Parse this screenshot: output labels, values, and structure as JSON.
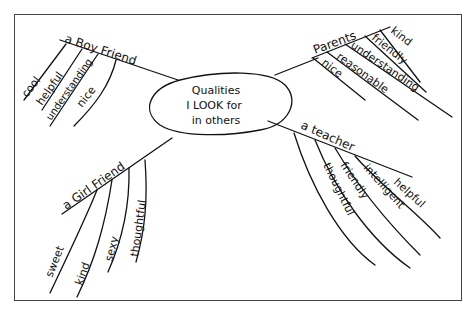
{
  "center": {
    "lines": [
      "Qualities",
      "I LOOK for",
      "in others"
    ]
  },
  "branches": [
    {
      "id": "boyfriend",
      "label": "a Boy Friend",
      "qualities": [
        "cool",
        "helpful",
        "understanding",
        "nice"
      ]
    },
    {
      "id": "parents",
      "label": "Parents",
      "qualities": [
        "kind",
        "friendly",
        "understanding",
        "reasonable",
        "nice"
      ]
    },
    {
      "id": "girlfriend",
      "label": "a Girl Friend",
      "qualities": [
        "sweet",
        "kind",
        "sexy",
        "thoughtful"
      ]
    },
    {
      "id": "teacher",
      "label": "a teacher",
      "qualities": [
        "helpful",
        "intelligent",
        "friendly",
        "thoughtful"
      ]
    }
  ],
  "colors": {
    "ink": "#111111",
    "paper": "#ffffff",
    "border": "#444444"
  }
}
